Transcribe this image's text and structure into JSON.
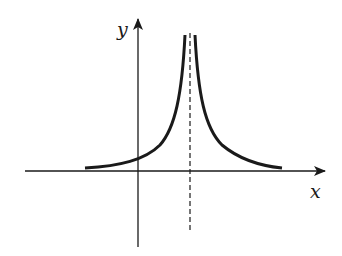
{
  "figure": {
    "type": "function-graph",
    "axes": {
      "x_label": "x",
      "y_label": "y"
    },
    "asymptote": {
      "style": "dashed",
      "orientation": "vertical"
    },
    "colors": {
      "ink": "#1a1a1a",
      "background": "#ffffff"
    }
  }
}
